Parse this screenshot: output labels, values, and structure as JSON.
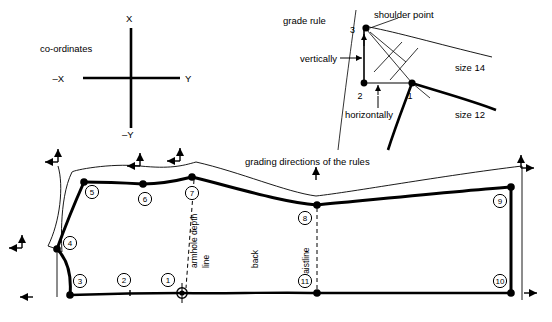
{
  "figure": {
    "type": "technical-pattern-grading-diagram"
  },
  "coordinates": {
    "caption": "co-ordinates",
    "axis_up": "X",
    "axis_down": "–Y",
    "axis_right": "Y",
    "axis_left": "–X"
  },
  "grade_rule": {
    "title": "grade rule",
    "shoulder_point": "shoulder point",
    "vertically": "vertically",
    "horizontally": "horizontally",
    "point_3": "3",
    "point_2": "2",
    "point_1": "1",
    "size_large": "size 14",
    "size_small": "size 12"
  },
  "pattern": {
    "grading_note": "grading directions of the rules",
    "armhole_depth_line_1": "armhole depth",
    "armhole_depth_line_2": "line",
    "back_label": "back",
    "waistline_label": "waistline",
    "points": [
      {
        "id": "1",
        "cx": 182,
        "cy": 293,
        "lx": 168,
        "ly": 280,
        "marker": "target"
      },
      {
        "id": "2",
        "cx": 130,
        "cy": 293,
        "lx": 124,
        "ly": 280,
        "marker": "tick"
      },
      {
        "id": "3",
        "cx": 70,
        "cy": 295,
        "lx": 80,
        "ly": 281,
        "marker": "dot"
      },
      {
        "id": "4",
        "cx": 57,
        "cy": 249,
        "lx": 70,
        "ly": 243,
        "marker": "dot"
      },
      {
        "id": "5",
        "cx": 84,
        "cy": 182,
        "lx": 92,
        "ly": 192,
        "marker": "dot"
      },
      {
        "id": "6",
        "cx": 143,
        "cy": 184,
        "lx": 145,
        "ly": 199,
        "marker": "dot"
      },
      {
        "id": "7",
        "cx": 192,
        "cy": 177,
        "lx": 192,
        "ly": 193,
        "marker": "dot"
      },
      {
        "id": "8",
        "cx": 317,
        "cy": 205,
        "lx": 305,
        "ly": 218,
        "marker": "dot"
      },
      {
        "id": "9",
        "cx": 511,
        "cy": 187,
        "lx": 500,
        "ly": 201,
        "marker": "dot"
      },
      {
        "id": "10",
        "cx": 511,
        "cy": 293,
        "lx": 500,
        "ly": 281,
        "marker": "dot"
      },
      {
        "id": "11",
        "cx": 317,
        "cy": 293,
        "lx": 305,
        "ly": 281,
        "marker": "dot"
      }
    ],
    "grading_arrows": [
      {
        "name": "arrow-point-5",
        "x": 58,
        "y": 149,
        "dir": "up-left"
      },
      {
        "name": "arrow-point-6",
        "x": 140,
        "y": 153,
        "dir": "up-left"
      },
      {
        "name": "arrow-point-7",
        "x": 180,
        "y": 148,
        "dir": "up-left"
      },
      {
        "name": "arrow-point-4",
        "x": 22,
        "y": 235,
        "dir": "up-left"
      },
      {
        "name": "arrow-point-9",
        "x": 521,
        "y": 155,
        "dir": "up-right"
      },
      {
        "name": "arrow-point-3",
        "x": 20,
        "y": 297,
        "dir": "left"
      },
      {
        "name": "arrow-point-10",
        "x": 524,
        "y": 293,
        "dir": "right"
      },
      {
        "name": "arrow-waist-up",
        "x": 316,
        "y": 167,
        "dir": "up"
      }
    ]
  }
}
